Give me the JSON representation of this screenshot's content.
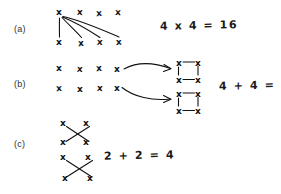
{
  "page": {
    "background_color": "#ffffff",
    "ink_color": "#111111",
    "width": 281,
    "height": 194
  },
  "rows": [
    {
      "label": "(a)",
      "equation": "4 x 4 = 16",
      "mark_symbol": "x",
      "marks_top_row": [
        "x",
        "x",
        "x",
        "x"
      ],
      "marks_bottom_row": [
        "x",
        "x",
        "x",
        "x"
      ],
      "connector_count": 4,
      "connector_style": "fan-lines-from-first-top-mark"
    },
    {
      "label": "(b)",
      "equation": "4 + 4 = 8",
      "mark_symbol": "x",
      "marks_row_one": [
        "x",
        "x",
        "x",
        "x"
      ],
      "marks_row_two": [
        "x",
        "x",
        "x",
        "x"
      ],
      "arrow_count": 2,
      "arrow_style": "curved-right-arrow",
      "result_groups": [
        {
          "corners": [
            "x",
            "x",
            "x",
            "x"
          ],
          "shape": "square-outline"
        },
        {
          "corners": [
            "x",
            "x",
            "x",
            "x"
          ],
          "shape": "square-outline"
        }
      ]
    },
    {
      "label": "(c)",
      "equation": "2 + 2 = 4",
      "mark_symbol": "x",
      "groups": [
        {
          "corners": [
            "x",
            "x",
            "x",
            "x"
          ],
          "shape": "crossed-diagonals"
        },
        {
          "corners": [
            "x",
            "x",
            "x",
            "x"
          ],
          "shape": "crossed-diagonals"
        }
      ]
    }
  ]
}
